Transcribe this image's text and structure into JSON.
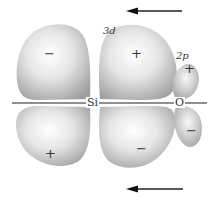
{
  "diagram": {
    "atoms": {
      "left": "Si",
      "right": "O"
    },
    "orbitals": {
      "silicon": "3d",
      "oxygen": "2p"
    },
    "lobes": {
      "si_upper_left": "−",
      "si_upper_right": "+",
      "si_lower_left": "+",
      "si_lower_right": "−",
      "o_upper": "+",
      "o_lower": "−"
    },
    "arrows": [
      {
        "position": "top",
        "direction": "left"
      },
      {
        "position": "bottom",
        "direction": "left"
      }
    ],
    "colors": {
      "lobe_light": "#ffffff",
      "lobe_dark": "#a8a8a8",
      "line": "#222222"
    }
  }
}
